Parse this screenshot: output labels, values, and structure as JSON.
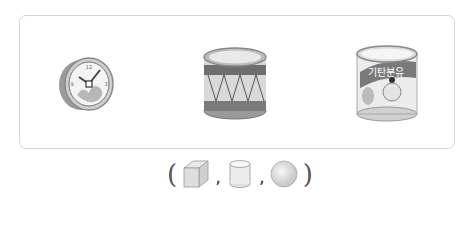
{
  "problem": {
    "objects": [
      {
        "name": "clock",
        "description": "round wall clock (cylinder shape)"
      },
      {
        "name": "drum",
        "description": "drum (cylinder shape)"
      },
      {
        "name": "formula-can",
        "label": "기탄분유",
        "description": "baby formula can (cylinder shape)"
      }
    ],
    "answer_choices": {
      "open_paren": "(",
      "close_paren": ")",
      "separator": ",",
      "shapes": [
        {
          "name": "cube",
          "icon": "cube-icon"
        },
        {
          "name": "cylinder",
          "icon": "cylinder-icon"
        },
        {
          "name": "sphere",
          "icon": "sphere-icon"
        }
      ]
    }
  },
  "colors": {
    "frame_border": "#d6d6d6",
    "object_dark": "#6e6e6e",
    "object_mid": "#a8a8a8",
    "object_light": "#e6e6e6",
    "text": "#555555"
  }
}
